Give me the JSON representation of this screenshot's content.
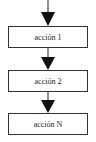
{
  "diagram": {
    "type": "flowchart-sequence",
    "steps": [
      {
        "label": "acción 1"
      },
      {
        "label": "acción 2"
      },
      {
        "label": "acción N"
      }
    ],
    "colors": {
      "stroke": "#222222",
      "background": "#ffffff"
    }
  }
}
